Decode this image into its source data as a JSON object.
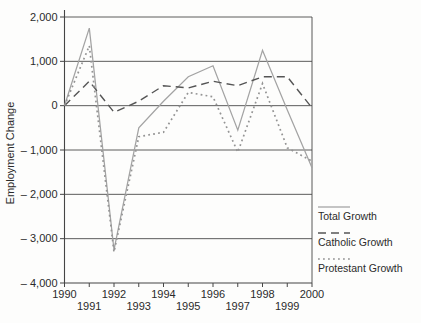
{
  "figure": {
    "background": "#fdfdfc"
  },
  "chart_data": {
    "type": "line",
    "title": "",
    "xlabel": "",
    "ylabel": "Employment Change",
    "x": [
      1990,
      1991,
      1992,
      1993,
      1994,
      1995,
      1996,
      1997,
      1998,
      1999,
      2000
    ],
    "xtick_labels": [
      "1990",
      "1991",
      "1992",
      "1993",
      "1994",
      "1995",
      "1996",
      "1997",
      "1998",
      "1999",
      "2000"
    ],
    "xtick_stagger": "even-top-odd-bottom",
    "ylim": [
      -4000,
      2000
    ],
    "ytick_values": [
      2000,
      1000,
      0,
      -1000,
      -2000,
      -3000,
      -4000
    ],
    "ytick_labels": [
      "2,000",
      "1,000",
      "0",
      "– 1,000",
      "– 2,000",
      "– 3,000",
      "– 4,000"
    ],
    "grid": "horizontal",
    "legend_position": "outside-right-bottom",
    "series": [
      {
        "name": "Total Growth",
        "line_style": "solid",
        "color": "#a3a3a3",
        "values": [
          0,
          1750,
          -3250,
          -500,
          100,
          650,
          900,
          -550,
          1250,
          -100,
          -1400
        ]
      },
      {
        "name": "Catholic Growth",
        "line_style": "dashed",
        "color": "#555555",
        "values": [
          0,
          550,
          -150,
          100,
          450,
          400,
          550,
          450,
          650,
          650,
          -50
        ]
      },
      {
        "name": "Protestant Growth",
        "line_style": "dotted",
        "color": "#949494",
        "values": [
          0,
          1350,
          -3300,
          -700,
          -600,
          300,
          200,
          -1050,
          500,
          -950,
          -1250
        ]
      }
    ]
  },
  "legend": {
    "items": [
      {
        "label": "Total Growth",
        "style": "solid"
      },
      {
        "label": "Catholic Growth",
        "style": "dashed"
      },
      {
        "label": "Protestant Growth",
        "style": "dotted"
      }
    ]
  },
  "colors": {
    "axis": "#454545",
    "grid": "#4a4a4a",
    "text": "#2b2b2b"
  }
}
